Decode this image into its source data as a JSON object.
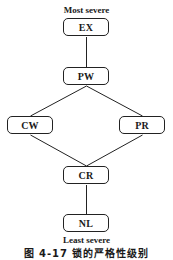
{
  "diagram": {
    "top_label": "Most severe",
    "bottom_label": "Least severe",
    "caption": "图 4-17  锁的严格性级别",
    "nodes": {
      "ex": "EX",
      "pw": "PW",
      "cw": "CW",
      "pr": "PR",
      "cr": "CR",
      "nl": "NL"
    },
    "edges": [
      [
        "EX",
        "PW"
      ],
      [
        "PW",
        "CW"
      ],
      [
        "PW",
        "PR"
      ],
      [
        "CW",
        "CR"
      ],
      [
        "PR",
        "CR"
      ],
      [
        "CR",
        "NL"
      ]
    ],
    "line_color": "#222222"
  }
}
